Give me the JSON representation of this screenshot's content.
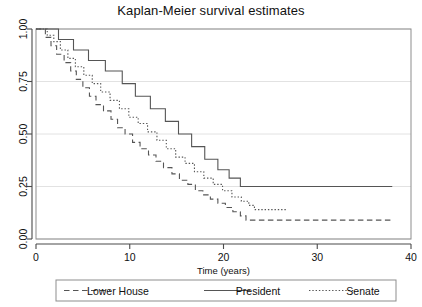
{
  "chart_data": {
    "type": "line",
    "title": "Kaplan-Meier survival estimates",
    "xlabel": "Time (years)",
    "ylabel": "",
    "xlim": [
      0,
      40
    ],
    "ylim": [
      0.0,
      1.0
    ],
    "grid": true,
    "legend_position": "bottom",
    "x_ticks": [
      "0",
      "10",
      "20",
      "30",
      "40"
    ],
    "x_tick_values": [
      0,
      10,
      20,
      30,
      40
    ],
    "y_ticks": [
      "0.00",
      "0.25",
      "0.50",
      "0.75",
      "1.00"
    ],
    "y_tick_values": [
      0.0,
      0.25,
      0.5,
      0.75,
      1.0
    ],
    "series": [
      {
        "name": "Lower House",
        "style": "dashed",
        "color": "#555555",
        "x": [
          0,
          1.0,
          1.6,
          2.2,
          3.0,
          3.7,
          4.3,
          5.0,
          5.7,
          6.4,
          7.2,
          8.0,
          8.7,
          9.5,
          10.3,
          11.1,
          12.0,
          12.8,
          13.6,
          14.5,
          15.3,
          16.2,
          17.0,
          17.8,
          18.6,
          19.4,
          20.2,
          21.0,
          21.8,
          22.4,
          38.0
        ],
        "y": [
          1.0,
          0.96,
          0.92,
          0.88,
          0.84,
          0.8,
          0.76,
          0.72,
          0.68,
          0.64,
          0.61,
          0.57,
          0.53,
          0.5,
          0.46,
          0.43,
          0.4,
          0.37,
          0.34,
          0.31,
          0.28,
          0.26,
          0.23,
          0.21,
          0.19,
          0.17,
          0.15,
          0.13,
          0.11,
          0.09,
          0.09
        ]
      },
      {
        "name": "President",
        "style": "solid",
        "color": "#555555",
        "x": [
          0,
          0.7,
          2.4,
          4.0,
          5.6,
          7.4,
          9.2,
          10.6,
          12.2,
          13.8,
          15.2,
          16.6,
          18.0,
          19.4,
          20.6,
          21.8,
          38.0
        ],
        "y": [
          1.0,
          1.0,
          0.95,
          0.9,
          0.85,
          0.8,
          0.74,
          0.68,
          0.62,
          0.56,
          0.5,
          0.44,
          0.38,
          0.33,
          0.29,
          0.25,
          0.25
        ]
      },
      {
        "name": "Senate",
        "style": "dotted",
        "color": "#555555",
        "x": [
          0,
          1.2,
          1.9,
          2.6,
          3.4,
          4.2,
          5.1,
          6.0,
          6.9,
          7.9,
          8.9,
          9.9,
          10.9,
          11.9,
          12.9,
          13.9,
          14.9,
          15.9,
          16.9,
          17.9,
          18.9,
          19.9,
          20.9,
          21.9,
          22.7,
          23.3,
          26.8
        ],
        "y": [
          1.0,
          0.97,
          0.94,
          0.9,
          0.86,
          0.82,
          0.78,
          0.74,
          0.7,
          0.66,
          0.62,
          0.58,
          0.55,
          0.51,
          0.47,
          0.43,
          0.39,
          0.36,
          0.32,
          0.29,
          0.26,
          0.23,
          0.2,
          0.18,
          0.16,
          0.14,
          0.14
        ]
      }
    ]
  },
  "legend": {
    "entries": [
      {
        "label": "Lower House",
        "style": "dashed"
      },
      {
        "label": "President",
        "style": "solid"
      },
      {
        "label": "Senate",
        "style": "dotted"
      }
    ]
  }
}
